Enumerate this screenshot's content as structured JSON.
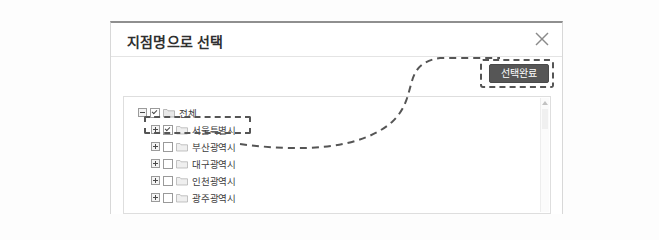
{
  "dialog": {
    "title": "지점명으로 선택",
    "close_icon": "close-icon",
    "complete_button_label": "선택완료"
  },
  "tree": {
    "root": {
      "label": "전체",
      "toggle": "minus",
      "checked": true
    },
    "children": [
      {
        "label": "서울특별시",
        "toggle": "plus",
        "checked": true,
        "highlighted": true
      },
      {
        "label": "부산광역시",
        "toggle": "plus",
        "checked": false,
        "highlighted": false
      },
      {
        "label": "대구광역시",
        "toggle": "plus",
        "checked": false,
        "highlighted": false
      },
      {
        "label": "인천광역시",
        "toggle": "plus",
        "checked": false,
        "highlighted": false
      },
      {
        "label": "광주광역시",
        "toggle": "plus",
        "checked": false,
        "highlighted": false
      }
    ]
  },
  "annotation": {
    "highlight_color": "#555555",
    "style": "dashed"
  },
  "colors": {
    "button_bg": "#565656",
    "button_text": "#ffffff",
    "page_bg": "#fdfdfd",
    "dialog_bg": "#ffffff",
    "title_text": "#2f2f2f"
  }
}
